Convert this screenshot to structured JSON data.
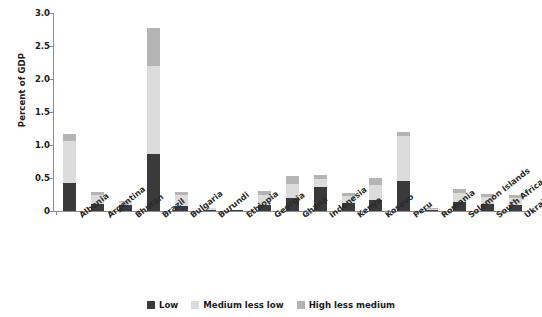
{
  "chart_data": {
    "type": "bar",
    "subtype": "stacked-vertical",
    "title": "FIGURE 4.1   Fiscal Cost of Social Assistance Programs, by Income Group",
    "xlabel": "",
    "ylabel": "Percent of GDP",
    "ylim": [
      0,
      3.0
    ],
    "yticks": [
      0,
      0.5,
      1.0,
      1.5,
      2.0,
      2.5,
      3.0
    ],
    "ytick_labels": [
      "0",
      "0.5",
      "1.0",
      "1.5",
      "2.0",
      "2.5",
      "3.0"
    ],
    "grid": false,
    "legend_position": "bottom",
    "categories": [
      "Albania",
      "Argentina",
      "Bhutan",
      "Brazil",
      "Bulgaria",
      "Burundi",
      "Ethiopia",
      "Georgia",
      "Ghana",
      "Indonesia",
      "Kenya",
      "Kosovo",
      "Peru",
      "Romania",
      "Solomon Islands",
      "South Africa",
      "Ukraine"
    ],
    "series": [
      {
        "name": "Low",
        "color": "#3a3a3a",
        "values": [
          0.43,
          0.1,
          0.09,
          0.87,
          0.07,
          0.02,
          0.01,
          0.09,
          0.2,
          0.37,
          0.12,
          0.17,
          0.45,
          0.02,
          0.14,
          0.1,
          0.09
        ]
      },
      {
        "name": "Medium less low",
        "color": "#dcdcdc",
        "values": [
          0.63,
          0.15,
          0.04,
          1.32,
          0.18,
          0.02,
          0.01,
          0.16,
          0.21,
          0.11,
          0.11,
          0.23,
          0.69,
          0.01,
          0.13,
          0.11,
          0.1
        ]
      },
      {
        "name": "High less medium",
        "color": "#b4b4b4",
        "values": [
          0.11,
          0.04,
          0.02,
          0.59,
          0.04,
          0.01,
          0.0,
          0.06,
          0.12,
          0.06,
          0.05,
          0.1,
          0.06,
          0.01,
          0.07,
          0.05,
          0.05
        ]
      }
    ],
    "totals": [
      1.17,
      0.29,
      0.15,
      2.78,
      0.29,
      0.05,
      0.02,
      0.31,
      0.53,
      0.54,
      0.28,
      0.5,
      1.2,
      0.04,
      0.34,
      0.26,
      0.24
    ]
  },
  "legend": {
    "items": [
      {
        "label": "Low"
      },
      {
        "label": "Medium less low"
      },
      {
        "label": "High less medium"
      }
    ]
  }
}
